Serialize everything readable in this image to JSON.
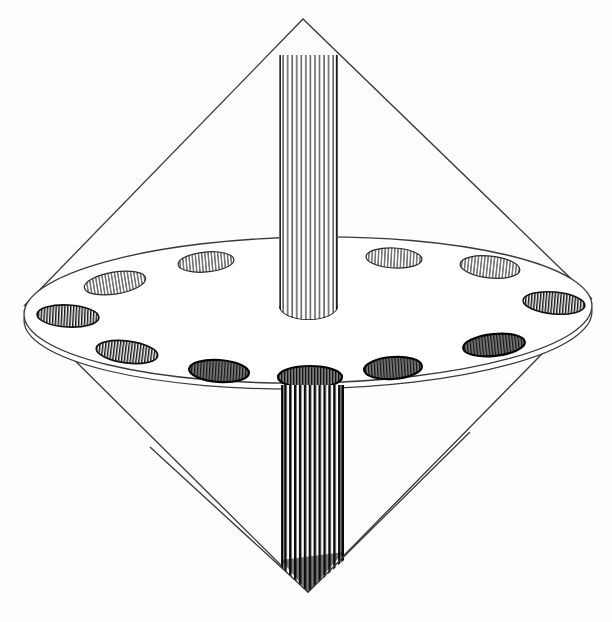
{
  "figure": {
    "style": "vintage line engraving, black ink on off-white paper",
    "background_color": "#fdfdfc",
    "ink_color": "#1a1a1a",
    "line_color": "#333333",
    "canvas": {
      "width": 612,
      "height": 622
    }
  },
  "chart_data": {
    "type": "diagram",
    "xlabel": "",
    "ylabel": "",
    "grid": false,
    "legend": "none",
    "elements": [
      {
        "name": "upper-cone",
        "kind": "cone",
        "apex": {
          "x": 303,
          "y": 19
        },
        "base_left": {
          "x": 24,
          "y": 307
        },
        "base_right": {
          "x": 592,
          "y": 300
        },
        "stroke": "#333333",
        "stroke_width": 1.3,
        "fill": "none"
      },
      {
        "name": "lower-cone",
        "kind": "cone",
        "apex": {
          "x": 308,
          "y": 592
        },
        "base_left": {
          "x": 24,
          "y": 312
        },
        "base_right": {
          "x": 592,
          "y": 305
        },
        "stroke": "#333333",
        "stroke_width": 1.3,
        "fill": "none"
      },
      {
        "name": "disc-top-ellipse",
        "kind": "ellipse",
        "cx": 308,
        "cy": 310,
        "rx": 284,
        "ry": 74,
        "rotation_deg": -0.8,
        "stroke": "#333333",
        "stroke_width": 1.3,
        "fill": "#ffffff"
      },
      {
        "name": "disc-bottom-ellipse",
        "kind": "ellipse",
        "cx": 308,
        "cy": 316,
        "rx": 284,
        "ry": 74,
        "rotation_deg": -0.8,
        "stroke": "#333333",
        "stroke_width": 1.2,
        "fill": "none"
      },
      {
        "name": "upper-spindle",
        "kind": "hatched-cylinder",
        "x_left": 279,
        "x_right": 338,
        "y_top": 55,
        "y_bottom": 320,
        "hatch_lines": 13,
        "tone": "light",
        "bottom_cap": "ellipse"
      },
      {
        "name": "lower-spindle",
        "kind": "hatched-cylinder",
        "x_left": 281,
        "x_right": 344,
        "y_top": 385,
        "y_bottom": 592,
        "hatch_lines": 13,
        "tone": "dark",
        "bottom_cap": "v-point"
      }
    ],
    "holes": [
      {
        "index": 1,
        "label": "hole-rear-left",
        "cx": 115,
        "cy": 283,
        "rx": 31,
        "ry": 11,
        "rotation_deg": -9,
        "tone": "light",
        "position": "rear"
      },
      {
        "index": 2,
        "label": "hole-rear-left-mid",
        "cx": 206,
        "cy": 262,
        "rx": 28,
        "ry": 10,
        "rotation_deg": -5,
        "tone": "light",
        "position": "rear"
      },
      {
        "index": 3,
        "label": "hole-rear-right-mid",
        "cx": 394,
        "cy": 258,
        "rx": 28,
        "ry": 10,
        "rotation_deg": 3,
        "tone": "light",
        "position": "rear"
      },
      {
        "index": 4,
        "label": "hole-rear-right",
        "cx": 490,
        "cy": 267,
        "rx": 30,
        "ry": 11,
        "rotation_deg": 6,
        "tone": "light",
        "position": "rear"
      },
      {
        "index": 5,
        "label": "hole-right-side",
        "cx": 554,
        "cy": 303,
        "rx": 31,
        "ry": 11,
        "rotation_deg": 5,
        "tone": "mid",
        "position": "side"
      },
      {
        "index": 6,
        "label": "hole-front-right",
        "cx": 494,
        "cy": 345,
        "rx": 31,
        "ry": 11,
        "rotation_deg": -6,
        "tone": "dark",
        "position": "front"
      },
      {
        "index": 7,
        "label": "hole-front-right-mid",
        "cx": 393,
        "cy": 368,
        "rx": 29,
        "ry": 11,
        "rotation_deg": -4,
        "tone": "dark",
        "position": "front"
      },
      {
        "index": 8,
        "label": "hole-front-center",
        "cx": 310,
        "cy": 377,
        "rx": 32,
        "ry": 11,
        "rotation_deg": 0,
        "tone": "dark",
        "position": "front"
      },
      {
        "index": 9,
        "label": "hole-front-left-mid",
        "cx": 219,
        "cy": 371,
        "rx": 30,
        "ry": 11,
        "rotation_deg": 4,
        "tone": "dark",
        "position": "front"
      },
      {
        "index": 10,
        "label": "hole-front-left",
        "cx": 127,
        "cy": 352,
        "rx": 31,
        "ry": 11,
        "rotation_deg": 7,
        "tone": "mid",
        "position": "front"
      },
      {
        "index": 11,
        "label": "hole-left-side",
        "cx": 68,
        "cy": 316,
        "rx": 31,
        "ry": 11,
        "rotation_deg": 3,
        "tone": "mid",
        "position": "side"
      },
      {
        "index": 12,
        "label": "hole-rear-far-left",
        "cx": 63,
        "cy": 294,
        "rx": 0,
        "ry": 0,
        "rotation_deg": 0,
        "tone": "none",
        "position": "hidden"
      }
    ],
    "hole_count_visible": 11
  }
}
